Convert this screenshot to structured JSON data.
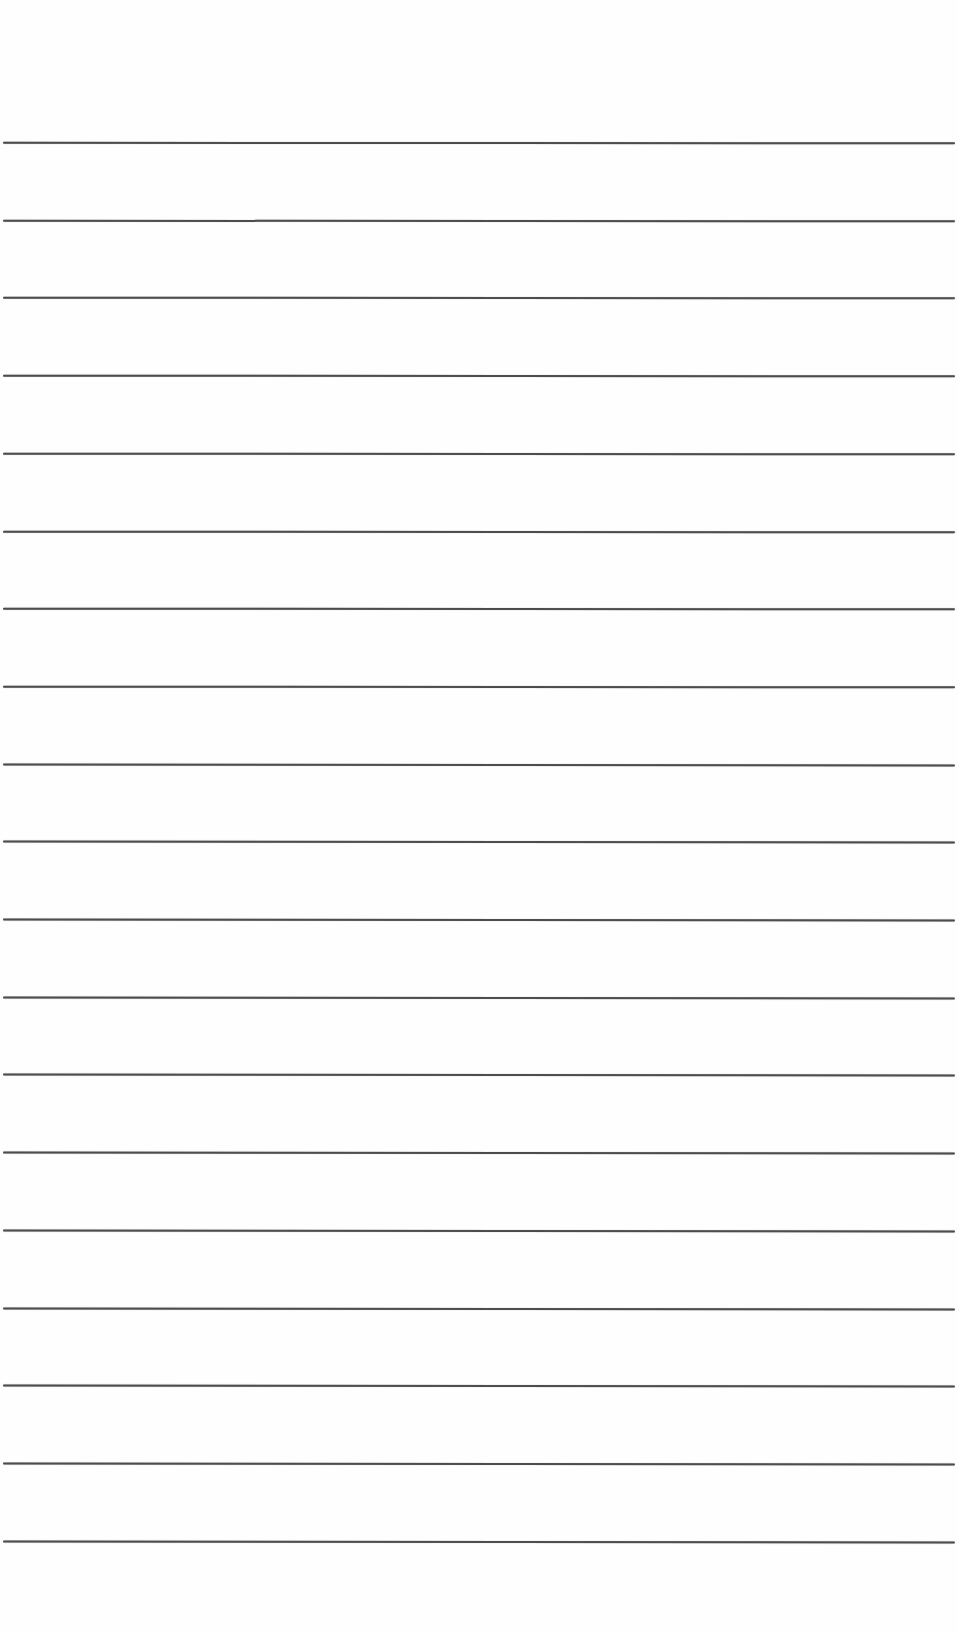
{
  "page": {
    "type": "lined-paper",
    "background_color": "#fefefe",
    "line_color": "#3a3a3a",
    "line_count": 19,
    "first_line_y": 142,
    "line_spacing": 77.7,
    "line_left": 3,
    "line_width": 952
  }
}
